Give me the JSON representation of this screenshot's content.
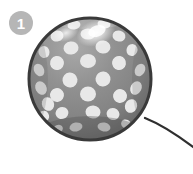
{
  "scene": {
    "width": 193,
    "height": 174,
    "background_color": "#ffffff",
    "description": "Grayscale photo-style polka-dot balloon with a curving string, annotated with a numbered badge"
  },
  "annotation_badge": {
    "label": "1",
    "shape": "circle",
    "fill_color": "#b6b6b6",
    "text_color": "#ffffff",
    "center_x": 21,
    "center_y": 23,
    "radius": 12
  },
  "balloon": {
    "name": "polka-dot-balloon",
    "center_x": 90,
    "center_y": 79,
    "radius": 62,
    "body_color": "#8b8b8b",
    "body_color_dark": "#6e6e6e",
    "body_color_light": "#a9a9a9",
    "outline_color": "#3a3a3a",
    "outline_width": 3,
    "dot_color": "#e8e8e8",
    "dot_count": 31,
    "highlight": {
      "name": "specular-highlight",
      "color": "#ffffff",
      "center_x": 96,
      "center_y": 33,
      "radius_x": 17,
      "radius_y": 10
    },
    "dots": [
      {
        "cx": 74,
        "cy": 25,
        "rx": 6.5,
        "ry": 4.5,
        "rot": -8
      },
      {
        "cx": 104,
        "cy": 24,
        "rx": 6.5,
        "ry": 4.5,
        "rot": 8
      },
      {
        "cx": 57,
        "cy": 36,
        "rx": 6.5,
        "ry": 5.5,
        "rot": -14
      },
      {
        "cx": 88,
        "cy": 34,
        "rx": 7.5,
        "ry": 5.5,
        "rot": 0
      },
      {
        "cx": 119,
        "cy": 36,
        "rx": 6.5,
        "ry": 5.5,
        "rot": 14
      },
      {
        "cx": 44,
        "cy": 52,
        "rx": 5.5,
        "ry": 6.0,
        "rot": -22
      },
      {
        "cx": 71,
        "cy": 48,
        "rx": 7.5,
        "ry": 6.5,
        "rot": -6
      },
      {
        "cx": 103,
        "cy": 47,
        "rx": 7.5,
        "ry": 6.5,
        "rot": 6
      },
      {
        "cx": 132,
        "cy": 50,
        "rx": 5.5,
        "ry": 6.0,
        "rot": 22
      },
      {
        "cx": 39,
        "cy": 70,
        "rx": 5.0,
        "ry": 6.5,
        "rot": -28
      },
      {
        "cx": 57,
        "cy": 63,
        "rx": 7.0,
        "ry": 7.0,
        "rot": -10
      },
      {
        "cx": 88,
        "cy": 61,
        "rx": 8.0,
        "ry": 7.0,
        "rot": 0
      },
      {
        "cx": 119,
        "cy": 63,
        "rx": 7.0,
        "ry": 7.0,
        "rot": 10
      },
      {
        "cx": 140,
        "cy": 70,
        "rx": 5.0,
        "ry": 6.5,
        "rot": 28
      },
      {
        "cx": 41,
        "cy": 88,
        "rx": 5.5,
        "ry": 7.0,
        "rot": -28
      },
      {
        "cx": 70,
        "cy": 80,
        "rx": 7.5,
        "ry": 7.5,
        "rot": -6
      },
      {
        "cx": 103,
        "cy": 79,
        "rx": 7.5,
        "ry": 7.5,
        "rot": 6
      },
      {
        "cx": 136,
        "cy": 88,
        "rx": 5.5,
        "ry": 7.0,
        "rot": 28
      },
      {
        "cx": 48,
        "cy": 104,
        "rx": 6.0,
        "ry": 7.0,
        "rot": -24
      },
      {
        "cx": 57,
        "cy": 95,
        "rx": 7.0,
        "ry": 7.0,
        "rot": -12
      },
      {
        "cx": 88,
        "cy": 94,
        "rx": 8.0,
        "ry": 7.5,
        "rot": 0
      },
      {
        "cx": 120,
        "cy": 96,
        "rx": 7.0,
        "ry": 7.0,
        "rot": 12
      },
      {
        "cx": 131,
        "cy": 106,
        "rx": 6.0,
        "ry": 7.0,
        "rot": 24
      },
      {
        "cx": 62,
        "cy": 113,
        "rx": 6.5,
        "ry": 6.0,
        "rot": -18
      },
      {
        "cx": 93,
        "cy": 112,
        "rx": 7.5,
        "ry": 6.5,
        "rot": 4
      },
      {
        "cx": 113,
        "cy": 114,
        "rx": 6.5,
        "ry": 6.0,
        "rot": 18
      },
      {
        "cx": 44,
        "cy": 116,
        "rx": 5.0,
        "ry": 5.5,
        "rot": -34
      },
      {
        "cx": 76,
        "cy": 127,
        "rx": 6.5,
        "ry": 4.5,
        "rot": -10
      },
      {
        "cx": 104,
        "cy": 127,
        "rx": 6.5,
        "ry": 4.5,
        "rot": 10
      },
      {
        "cx": 58,
        "cy": 129,
        "rx": 5.0,
        "ry": 4.0,
        "rot": -24
      },
      {
        "cx": 126,
        "cy": 124,
        "rx": 5.0,
        "ry": 4.5,
        "rot": 26
      }
    ]
  },
  "balloon_string": {
    "name": "balloon-string",
    "color": "#2f2f2f",
    "width": 2.2,
    "path": "M145,118 C160,124 176,134 193,147",
    "start_x": 145,
    "start_y": 118,
    "end_x": 193,
    "end_y": 147
  }
}
